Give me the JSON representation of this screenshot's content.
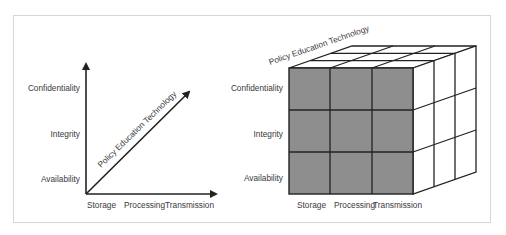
{
  "left_diagram": {
    "y_axis_labels": [
      "Confidentiality",
      "Integrity",
      "Availability"
    ],
    "x_axis_labels": [
      "Storage",
      "Processing",
      "Transmission"
    ],
    "diagonal_label": "Policy Education Technology"
  },
  "right_diagram": {
    "y_axis_labels": [
      "Confidentiality",
      "Integrity",
      "Availability"
    ],
    "x_axis_labels": [
      "Storage",
      "Processing",
      "Transmission"
    ],
    "depth_label": "Policy Education Technology",
    "front_face_color": "#8e8e8e",
    "grid_size": 3
  },
  "colors": {
    "line": "#222222",
    "frame": "#d6d6d6",
    "text": "#3a3a3a"
  }
}
